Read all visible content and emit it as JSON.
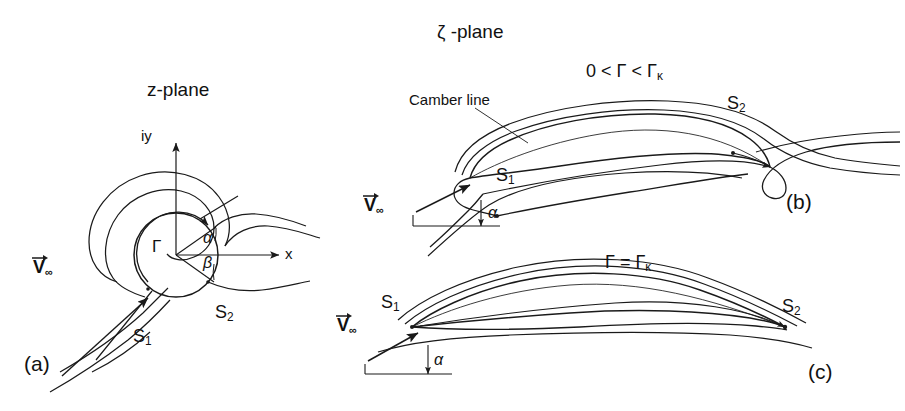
{
  "figure": {
    "domain": "fluid-dynamics-diagram",
    "line_color": "#1a1a1a",
    "background": "#ffffff"
  },
  "titles": {
    "z_plane": "z-plane",
    "zeta_plane": "ζ -plane"
  },
  "panels": {
    "a": {
      "tag": "(a)",
      "plane": "z-plane",
      "axes": {
        "x_label": "x",
        "y_label": "iy"
      },
      "labels": {
        "circulation": "Γ",
        "alpha": "α",
        "beta": "β",
        "stagnation_1": "S",
        "stagnation_1_sub": "1",
        "stagnation_2": "S",
        "stagnation_2_sub": "2",
        "freestream": "V",
        "freestream_sub": "∞"
      }
    },
    "b": {
      "tag": "(b)",
      "plane": "ζ -plane",
      "condition": "0 < Γ < Γ",
      "condition_sub": "κ",
      "camber_label": "Camber line",
      "labels": {
        "alpha": "α",
        "stagnation_1": "S",
        "stagnation_1_sub": "1",
        "stagnation_2": "S",
        "stagnation_2_sub": "2",
        "freestream": "V",
        "freestream_sub": "∞"
      }
    },
    "c": {
      "tag": "(c)",
      "plane": "ζ -plane",
      "condition": "Γ = Γ",
      "condition_sub": "κ",
      "labels": {
        "alpha": "α",
        "stagnation_1": "S",
        "stagnation_1_sub": "1",
        "stagnation_2": "S",
        "stagnation_2_sub": "2",
        "freestream": "V",
        "freestream_sub": "∞"
      }
    }
  }
}
